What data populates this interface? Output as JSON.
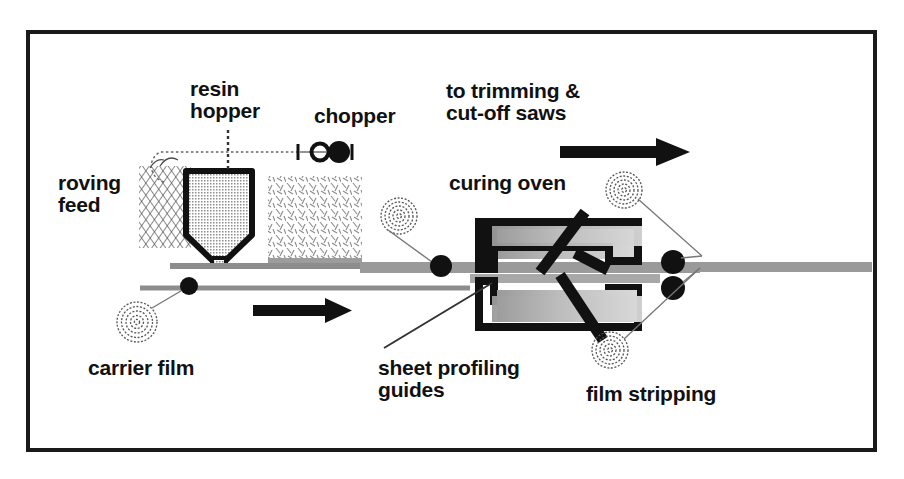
{
  "diagram": {
    "type": "process-flow-schematic",
    "frame": {
      "border_color": "#1a1a1a",
      "background": "#ffffff"
    },
    "colors": {
      "outline": "#111111",
      "fill_gray": "#b9b9b9",
      "sheet_gray": "#8f8f8f",
      "hatch": "#555555",
      "arrow": "#111111"
    },
    "labels": [
      {
        "id": "roving-feed",
        "text": "roving\nfeed",
        "x": 58,
        "y": 172,
        "size": 21,
        "align": "left"
      },
      {
        "id": "resin-hopper",
        "text": "resin\nhopper",
        "x": 190,
        "y": 78,
        "size": 21,
        "align": "left"
      },
      {
        "id": "chopper",
        "text": "chopper",
        "x": 314,
        "y": 105,
        "size": 21,
        "align": "left"
      },
      {
        "id": "trimming-saws",
        "text": "to trimming &\ncut-off saws",
        "x": 446,
        "y": 80,
        "size": 21,
        "align": "left"
      },
      {
        "id": "curing-oven",
        "text": "curing oven",
        "x": 449,
        "y": 172,
        "size": 21,
        "align": "left"
      },
      {
        "id": "carrier-film",
        "text": "carrier film",
        "x": 88,
        "y": 357,
        "size": 21,
        "align": "left"
      },
      {
        "id": "sheet-profiling",
        "text": "sheet profiling\nguides",
        "x": 378,
        "y": 357,
        "size": 21,
        "align": "left"
      },
      {
        "id": "film-stripping",
        "text": "film stripping",
        "x": 586,
        "y": 383,
        "size": 21,
        "align": "left"
      }
    ],
    "components": [
      {
        "id": "roving-feed-block",
        "name": "roving fiber crosshatch bundle"
      },
      {
        "id": "resin-hopper-body",
        "name": "resin hopper funnel"
      },
      {
        "id": "chopper-unit",
        "name": "chopper mechanism"
      },
      {
        "id": "chopped-fiber-fall",
        "name": "chopped fiber falling curtain"
      },
      {
        "id": "curing-oven-body",
        "name": "curing oven compaction platens"
      },
      {
        "id": "carrier-film-roll",
        "name": "lower carrier film supply roll"
      },
      {
        "id": "upper-film-roll",
        "name": "upper carrier film supply roll"
      },
      {
        "id": "film-stripping-top-roll",
        "name": "top film stripping take-up roll"
      },
      {
        "id": "film-stripping-bottom-roll",
        "name": "bottom film stripping take-up roll"
      },
      {
        "id": "pinch-rollers",
        "name": "pinch / nip rollers"
      },
      {
        "id": "sheet-web",
        "name": "compound sheet web"
      },
      {
        "id": "flow-arrow-bottom",
        "name": "process direction arrow"
      },
      {
        "id": "flow-arrow-top",
        "name": "output direction arrow"
      },
      {
        "id": "oven-slash",
        "name": "cutting / severing blade mark"
      }
    ],
    "flow_direction": "left-to-right"
  }
}
